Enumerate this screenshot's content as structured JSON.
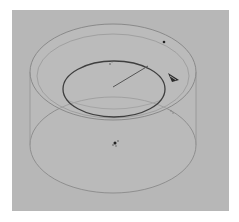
{
  "viewport": {
    "background": "#b7b7b7",
    "label": "3D viewport"
  },
  "scene": {
    "object": "translucent-cylinder",
    "colors": {
      "outline": "#8a8a8a",
      "rim": "#9a9a9a",
      "inner_ellipse": "#3f3f3f",
      "radius_line": "#555555",
      "arrow": "#2a2a2a",
      "marker": "#222222"
    },
    "cylinder": {
      "top": {
        "cx": 113,
        "cy": 72,
        "rx": 83,
        "ry": 48
      },
      "bottom": {
        "cx": 113,
        "cy": 145,
        "rx": 83,
        "ry": 48
      },
      "inner_rim": {
        "cx": 113,
        "cy": 76,
        "rx": 76,
        "ry": 42
      }
    },
    "inner_ellipse": {
      "cx": 114,
      "cy": 89,
      "rx": 51,
      "ry": 28
    },
    "radius_handle": {
      "x1": 113,
      "y1": 87,
      "x2": 148,
      "y2": 66
    },
    "arrow_gizmo": {
      "x": 172,
      "y": 77
    },
    "markers": [
      {
        "name": "top-point",
        "x": 164,
        "y": 42
      },
      {
        "name": "bottom-point",
        "x": 115,
        "y": 143
      },
      {
        "name": "inner-point",
        "x": 110,
        "y": 64
      }
    ]
  }
}
